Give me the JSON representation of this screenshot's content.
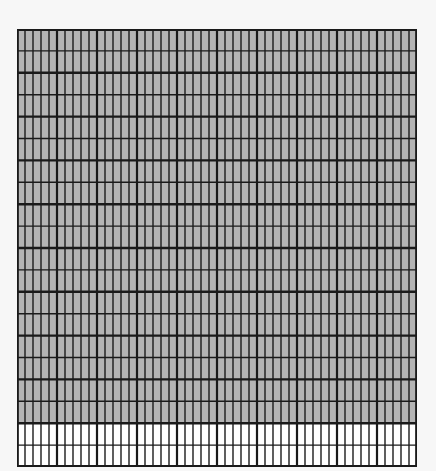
{
  "diagram": {
    "type": "shaded-grid",
    "columns": 50,
    "rows": 20,
    "shaded_rows": 18,
    "unshaded_rows": 2,
    "total_cells": 1000,
    "shaded_cells": 900,
    "shaded_fraction": 0.9,
    "major_column_every": 5,
    "major_row_every": 2,
    "colors": {
      "background": "#f7f7f7",
      "shaded_fill": "#b4b4b4",
      "unshaded_fill": "#ffffff",
      "line": "#1a1a1a"
    }
  }
}
